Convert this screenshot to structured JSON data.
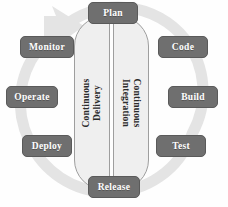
{
  "diagram": {
    "colors": {
      "stage_fill": "#6f6f6f",
      "stage_text": "#ffffff",
      "panel_fill": "#efefef",
      "panel_border": "#9e9e9e",
      "ring": "#e3e3e3",
      "background": "#fefefe"
    },
    "ring": {
      "name": "circular-arrow-ring",
      "direction": "clockwise",
      "arrowhead_position": "top-left"
    },
    "panels": [
      {
        "id": "continuous-delivery",
        "label": "Continuous Delivery",
        "line1": "Continuous",
        "line2": "Delivery",
        "side": "left",
        "rotation": -90
      },
      {
        "id": "continuous-integration",
        "label": "Continuous Integration",
        "line1": "Continuous",
        "line2": "Integration",
        "side": "right",
        "rotation": 90
      }
    ],
    "stages": [
      {
        "id": "plan",
        "label": "Plan",
        "position": "top",
        "order": 1,
        "group": "continuous-integration"
      },
      {
        "id": "code",
        "label": "Code",
        "position": "top-right",
        "order": 2,
        "group": "continuous-integration"
      },
      {
        "id": "build",
        "label": "Build",
        "position": "right",
        "order": 3,
        "group": "continuous-integration"
      },
      {
        "id": "test",
        "label": "Test",
        "position": "bottom-right",
        "order": 4,
        "group": "continuous-integration"
      },
      {
        "id": "release",
        "label": "Release",
        "position": "bottom",
        "order": 5,
        "group": "continuous-delivery"
      },
      {
        "id": "deploy",
        "label": "Deploy",
        "position": "bottom-left",
        "order": 6,
        "group": "continuous-delivery"
      },
      {
        "id": "operate",
        "label": "Operate",
        "position": "left",
        "order": 7,
        "group": "continuous-delivery"
      },
      {
        "id": "monitor",
        "label": "Monitor",
        "position": "top-left",
        "order": 8,
        "group": "continuous-delivery"
      }
    ]
  }
}
